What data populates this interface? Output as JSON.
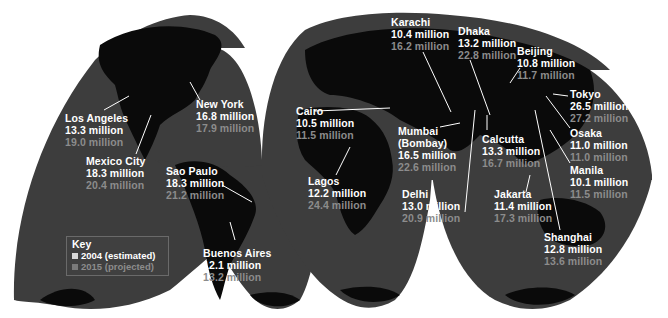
{
  "map": {
    "projection": "interrupted-goode-homolosine",
    "ocean_color": "#3d3d3d",
    "land_color": "#0a0a0a",
    "background_color": "#ffffff",
    "current_text_color": "#ffffff",
    "projected_text_color": "#8c8c8c"
  },
  "key": {
    "title": "Key",
    "items": [
      {
        "label": "2004 (estimated)",
        "color": "#d9d9d9"
      },
      {
        "label": "2015 (projected)",
        "color": "#7a7a7a"
      }
    ]
  },
  "cities": [
    {
      "name": "Los Angeles",
      "pop_2004": "13.3 million",
      "pop_2015": "19.0 million"
    },
    {
      "name": "New York",
      "pop_2004": "16.8 million",
      "pop_2015": "17.9 million"
    },
    {
      "name": "Mexico City",
      "pop_2004": "18.3 million",
      "pop_2015": "20.4 million"
    },
    {
      "name": "Sao Paulo",
      "pop_2004": "18.3 million",
      "pop_2015": "21.2 million"
    },
    {
      "name": "Buenos Aires",
      "pop_2004": "12.1 million",
      "pop_2015": "13.2 million"
    },
    {
      "name": "Cairo",
      "pop_2004": "10.5 million",
      "pop_2015": "11.5 million"
    },
    {
      "name": "Lagos",
      "pop_2004": "12.2 million",
      "pop_2015": "24.4 million"
    },
    {
      "name": "Karachi",
      "pop_2004": "10.4 million",
      "pop_2015": "16.2 million"
    },
    {
      "name": "Mumbai (Bombay)",
      "name_line1": "Mumbai",
      "name_line2": "(Bombay)",
      "pop_2004": "16.5 million",
      "pop_2015": "22.6 million"
    },
    {
      "name": "Delhi",
      "pop_2004": "13.0 million",
      "pop_2015": "20.9 million"
    },
    {
      "name": "Dhaka",
      "pop_2004": "13.2 million",
      "pop_2015": "22.8 million"
    },
    {
      "name": "Calcutta",
      "pop_2004": "13.3 million",
      "pop_2015": "16.7 million"
    },
    {
      "name": "Beijing",
      "pop_2004": "10.8 million",
      "pop_2015": "11.7 million"
    },
    {
      "name": "Tokyo",
      "pop_2004": "26.5 million",
      "pop_2015": "27.2 million"
    },
    {
      "name": "Osaka",
      "pop_2004": "11.0 million",
      "pop_2015": "11.0 million"
    },
    {
      "name": "Manila",
      "pop_2004": "10.1 million",
      "pop_2015": "11.5 million"
    },
    {
      "name": "Jakarta",
      "pop_2004": "11.4 million",
      "pop_2015": "17.3 million"
    },
    {
      "name": "Shanghai",
      "pop_2004": "12.8 million",
      "pop_2015": "13.6 million"
    }
  ]
}
